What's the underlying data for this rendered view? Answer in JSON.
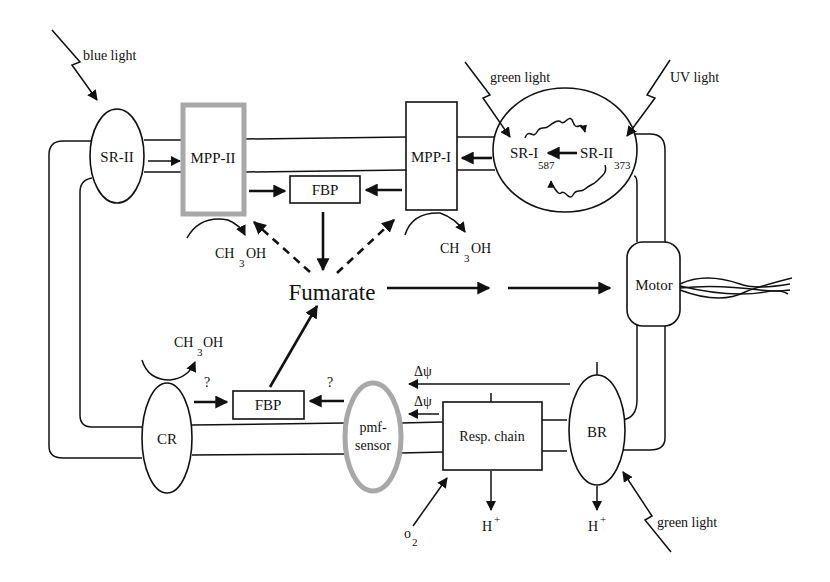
{
  "diagram": {
    "components": {
      "sr2_left": "SR-II",
      "mpp2": "MPP-II",
      "fbp_top": "FBP",
      "mpp1": "MPP-I",
      "sr1": "SR-I",
      "sr1_sub": "587",
      "sr2_right": "SR-II",
      "sr2_right_sub": "373",
      "motor": "Motor",
      "fumarate": "Fumarate",
      "cr": "CR",
      "fbp_bottom": "FBP",
      "pmf_line1": "pmf-",
      "pmf_line2": "sensor",
      "resp_chain": "Resp. chain",
      "br": "BR"
    },
    "stimuli": {
      "blue_light": "blue light",
      "green_light_top": "green light",
      "uv_light": "UV light",
      "green_light_bottom": "green light"
    },
    "chemicals": {
      "methanol_prefix": "CH",
      "methanol_sub": "3",
      "methanol_suffix": "OH",
      "o2_main": "o",
      "o2_sub": "2",
      "proton": "H",
      "proton_sup": "+",
      "delta_psi": "Δψ",
      "question": "?"
    },
    "colors": {
      "line": "#111111",
      "gray_border": "#a8a8a8",
      "background": "#ffffff"
    }
  }
}
